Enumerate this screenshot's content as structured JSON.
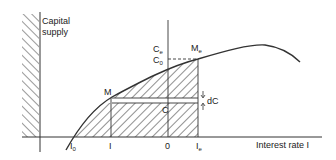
{
  "diagram": {
    "y_axis_label_line1": "Capital",
    "y_axis_label_line2": "supply",
    "x_axis_label": "Interest rate I",
    "x_ticks": [
      {
        "main": "I",
        "sub": "0"
      },
      {
        "main": "I",
        "sub": ""
      },
      {
        "main": "0",
        "sub": ""
      },
      {
        "main": "I",
        "sub": "e"
      }
    ],
    "point_labels": {
      "Me_main": "M",
      "Me_sub": "e",
      "M": "M",
      "Ce_main": "C",
      "Ce_sub": "e",
      "C0_main": "C",
      "C0_sub": "0",
      "C": "C",
      "dC": "dC"
    }
  }
}
